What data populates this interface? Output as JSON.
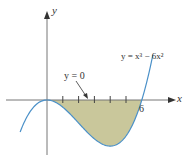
{
  "chart_data": {
    "type": "line",
    "title": "",
    "xlabel": "x",
    "ylabel": "y",
    "series": [
      {
        "name": "y = x^3 - 6x^2",
        "function": "x^3 - 6x^2",
        "x_range": [
          -1.7,
          6.7
        ],
        "color": "#4a90c8"
      }
    ],
    "shaded_region": {
      "between": [
        "y = x^3 - 6x^2",
        "y = 0"
      ],
      "x_range": [
        0,
        6
      ],
      "color": "#c9c79b"
    },
    "x_ticks": [
      1,
      2,
      3,
      4,
      5,
      6
    ],
    "labeled_ticks": {
      "6": "6"
    },
    "annotations": [
      {
        "text": "y = x³ − 6x²",
        "position": "upper-right"
      },
      {
        "text": "y = 0",
        "arrow_to": "x-axis near x=2.6"
      }
    ],
    "grid": false
  },
  "labels": {
    "y_axis": "y",
    "x_axis": "x",
    "tick_6": "6",
    "curve_label": "y = x³ − 6x²",
    "line_label": "y = 0"
  }
}
